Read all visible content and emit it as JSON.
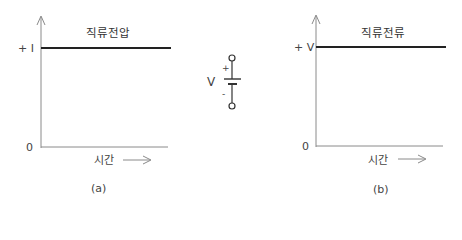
{
  "panels": [
    {
      "id": "a",
      "title": "직류전압",
      "y_level_label": "+ I",
      "origin_label": "0",
      "x_axis_label": "시간",
      "caption": "(a)"
    },
    {
      "id": "b",
      "title": "직류전류",
      "y_level_label": "+ V",
      "origin_label": "0",
      "x_axis_label": "시간",
      "caption": "(b)"
    }
  ],
  "source_symbol": {
    "label": "V",
    "plus": "+",
    "minus": "-"
  },
  "colors": {
    "axis": "#8a8a8a",
    "signal": "#222222",
    "text": "#444444"
  }
}
